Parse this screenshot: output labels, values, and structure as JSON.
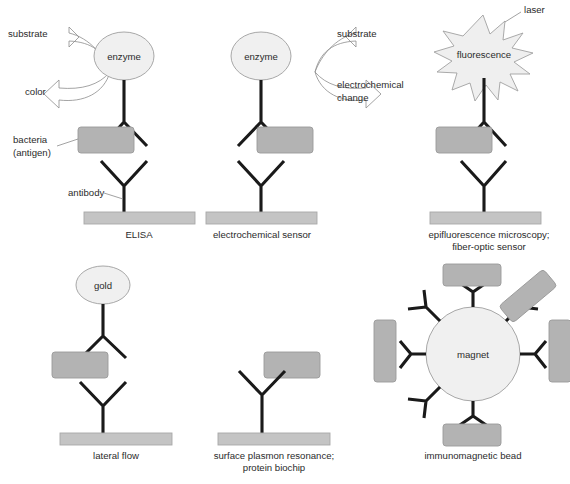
{
  "figure": {
    "background_color": "#ffffff",
    "colors": {
      "antigen_box": "#b3b3b3",
      "antigen_box_border": "#9a9a9a",
      "support_bar": "#c4c4c4",
      "support_bar_border": "#a8a8a8",
      "ellipse_fill": "#f0f0f0",
      "ellipse_border": "#9e9e9e",
      "burst_fill": "#efefef",
      "burst_border": "#a0a0a0",
      "antibody_stroke": "#1a1a1a",
      "leader_line": "#8a8a8a",
      "text": "#2b2b2b"
    }
  },
  "panels": [
    {
      "id": "elisa",
      "caption": "ELISA",
      "label_enzyme": "enzyme",
      "annotations": [
        {
          "name": "substrate",
          "text": "substrate"
        },
        {
          "name": "color",
          "text": "color"
        },
        {
          "name": "bacteria",
          "text": "bacteria"
        },
        {
          "name": "antigen",
          "text": "(antigen)"
        },
        {
          "name": "antibody",
          "text": "antibody"
        }
      ]
    },
    {
      "id": "electrochemical-sensor",
      "caption": "electrochemical sensor",
      "label_enzyme": "enzyme",
      "annotations": [
        {
          "name": "substrate",
          "text": "substrate"
        },
        {
          "name": "electrochemical",
          "text": "electrochemical"
        },
        {
          "name": "change",
          "text": "change"
        }
      ]
    },
    {
      "id": "epifluorescence",
      "caption_line1": "epifluorescence microscopy;",
      "caption_line2": "fiber-optic sensor",
      "label_burst": "fluorescence",
      "annotations": [
        {
          "name": "laser",
          "text": "laser"
        }
      ]
    },
    {
      "id": "lateral-flow",
      "caption": "lateral flow",
      "label_gold": "gold"
    },
    {
      "id": "surface-plasmon-resonance",
      "caption_line1": "surface plasmon resonance;",
      "caption_line2": "protein biochip"
    },
    {
      "id": "immunomagnetic-bead",
      "caption": "immunomagnetic bead",
      "label_magnet": "magnet"
    }
  ]
}
